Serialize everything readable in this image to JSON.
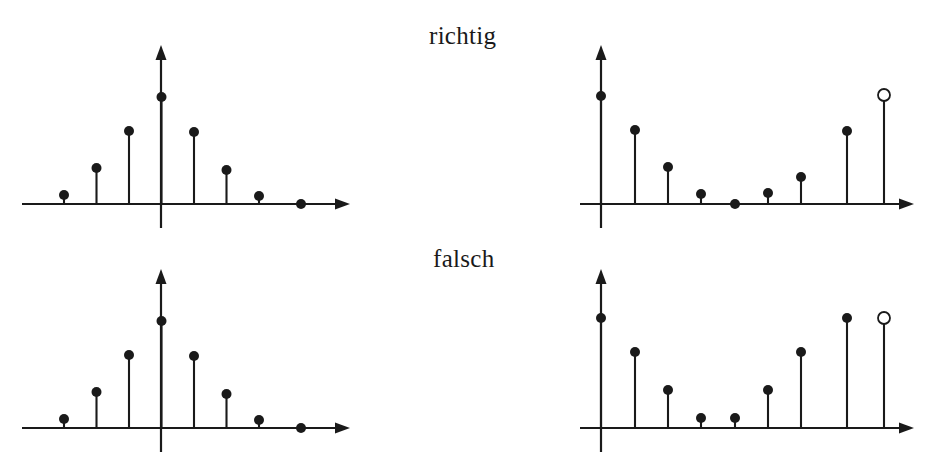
{
  "figure": {
    "width": 935,
    "height": 468,
    "background": "#ffffff",
    "ink_color": "#1a1a1a",
    "marker_fill": "#1a1a1a",
    "open_marker_fill": "#ffffff"
  },
  "labels": {
    "richtig": "richtig",
    "falsch": "falsch"
  },
  "chart_data": [
    {
      "id": "top-left",
      "type": "stem",
      "title": "",
      "xlabel": "",
      "ylabel": "",
      "row": "richtig",
      "column": "left",
      "origin": [
        161,
        204
      ],
      "axis_x": [
        22,
        350
      ],
      "axis_y_top": 45,
      "axis_y_bottom": 228,
      "sample_spacing": 32.5,
      "marker_radius": 5,
      "open_marker_radius": 6,
      "grid": false,
      "legend": null,
      "x": [
        -4,
        -3,
        -2,
        -1,
        0,
        1,
        2,
        3,
        4
      ],
      "y": [
        0.07,
        0.25,
        0.52,
        0.78,
        1.0,
        0.76,
        0.5,
        0.23,
        0.0
      ],
      "pixel_x": [
        31.5,
        64,
        96.5,
        129,
        161.5,
        194,
        226.5,
        259,
        301
      ],
      "pixel_y": [
        204,
        195,
        168,
        131,
        97,
        132,
        170,
        196,
        204
      ],
      "open_last": false,
      "first_sample_drawn": false
    },
    {
      "id": "top-right",
      "type": "stem",
      "title": "",
      "xlabel": "",
      "ylabel": "",
      "row": "richtig",
      "column": "right",
      "origin": [
        601,
        204
      ],
      "axis_x": [
        580,
        914
      ],
      "axis_y_top": 45,
      "axis_y_bottom": 228,
      "sample_spacing": 33.5,
      "marker_radius": 5,
      "open_marker_radius": 6,
      "grid": false,
      "legend": null,
      "x": [
        0,
        1,
        2,
        3,
        4,
        5,
        6,
        7,
        8
      ],
      "y": [
        0.69,
        0.48,
        0.25,
        0.08,
        0.0,
        0.08,
        0.19,
        0.5,
        0.72
      ],
      "pixel_x": [
        601,
        635,
        668,
        701,
        735,
        768,
        801,
        847,
        884
      ],
      "pixel_y": [
        96,
        130,
        167,
        194,
        204,
        193,
        177,
        131,
        95
      ],
      "open_last": true,
      "first_sample_drawn": true
    },
    {
      "id": "bottom-left",
      "type": "stem",
      "title": "",
      "xlabel": "",
      "ylabel": "",
      "row": "falsch",
      "column": "left",
      "origin": [
        161,
        428
      ],
      "axis_x": [
        22,
        350
      ],
      "axis_y_top": 269,
      "axis_y_bottom": 452,
      "sample_spacing": 32.5,
      "marker_radius": 5,
      "open_marker_radius": 6,
      "grid": false,
      "legend": null,
      "x": [
        -4,
        -3,
        -2,
        -1,
        0,
        1,
        2,
        3,
        4
      ],
      "y": [
        0.07,
        0.25,
        0.52,
        0.78,
        1.0,
        0.76,
        0.5,
        0.23,
        0.0
      ],
      "pixel_x": [
        31.5,
        64,
        96.5,
        129,
        161.5,
        194,
        226.5,
        259,
        301
      ],
      "pixel_y": [
        428,
        419,
        392,
        355,
        321,
        356,
        394,
        420,
        428
      ],
      "open_last": false,
      "first_sample_drawn": false
    },
    {
      "id": "bottom-right",
      "type": "stem",
      "title": "",
      "xlabel": "",
      "ylabel": "",
      "row": "falsch",
      "column": "right",
      "origin": [
        601,
        428
      ],
      "axis_x": [
        580,
        914
      ],
      "axis_y_top": 269,
      "axis_y_bottom": 452,
      "sample_spacing": 33.5,
      "marker_radius": 5,
      "open_marker_radius": 6,
      "grid": false,
      "legend": null,
      "x": [
        0,
        1,
        2,
        3,
        4,
        5,
        6,
        7,
        8
      ],
      "y": [
        0.74,
        0.56,
        0.33,
        0.1,
        0.1,
        0.33,
        0.56,
        0.74,
        0.74
      ],
      "pixel_x": [
        601,
        635,
        668,
        701,
        735,
        768,
        801,
        847,
        884
      ],
      "pixel_y": [
        318,
        352,
        390,
        418,
        418,
        390,
        352,
        318,
        318
      ],
      "open_last": true,
      "first_sample_drawn": true
    }
  ]
}
